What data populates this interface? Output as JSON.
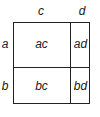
{
  "diagram": {
    "column_labels": [
      "c",
      "d"
    ],
    "row_labels": [
      "a",
      "b"
    ],
    "cells": [
      [
        "ac",
        "ad"
      ],
      [
        "bc",
        "bd"
      ]
    ],
    "line_color": "#222222"
  }
}
